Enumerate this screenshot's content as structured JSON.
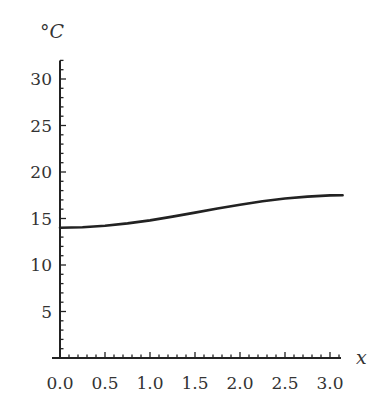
{
  "chart_data": {
    "type": "line",
    "title": "",
    "xlabel": "x",
    "ylabel": "°C",
    "xlim": [
      0,
      3.14159
    ],
    "ylim": [
      0,
      32
    ],
    "x_ticks": [
      0.0,
      0.5,
      1.0,
      1.5,
      2.0,
      2.5,
      3.0
    ],
    "x_tick_labels": [
      "0.0",
      "0.5",
      "1.0",
      "1.5",
      "2.0",
      "2.5",
      "3.0"
    ],
    "y_ticks": [
      5,
      10,
      15,
      20,
      25,
      30
    ],
    "y_tick_labels": [
      "5",
      "10",
      "15",
      "20",
      "25",
      "30"
    ],
    "x_minor_step": 0.1,
    "y_minor_step": 1,
    "grid": false,
    "legend": "none",
    "series": [
      {
        "name": "temperature",
        "color": "#222222",
        "x": [
          0.0,
          0.25,
          0.5,
          0.75,
          1.0,
          1.25,
          1.5,
          1.75,
          2.0,
          2.25,
          2.5,
          2.75,
          3.0,
          3.14
        ],
        "y": [
          14.0,
          14.05,
          14.21,
          14.47,
          14.8,
          15.2,
          15.63,
          16.07,
          16.48,
          16.86,
          17.15,
          17.36,
          17.48,
          17.5
        ]
      }
    ]
  }
}
